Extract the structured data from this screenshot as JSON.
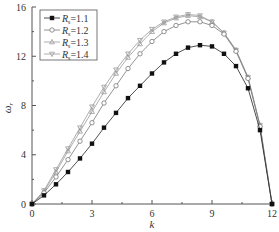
{
  "chart_data": {
    "type": "line",
    "title": "",
    "xlabel": "k",
    "ylabel": "ω_r",
    "xlim": [
      0,
      12
    ],
    "ylim": [
      0,
      16
    ],
    "xticks": [
      0,
      3,
      6,
      9,
      12
    ],
    "yticks": [
      0,
      4,
      8,
      12,
      16
    ],
    "grid": false,
    "legend_position": "upper left",
    "x": [
      0,
      0.6,
      1.2,
      1.8,
      2.4,
      3.0,
      3.6,
      4.2,
      4.8,
      5.4,
      6.0,
      6.6,
      7.2,
      7.8,
      8.4,
      9.0,
      9.6,
      10.2,
      10.8,
      11.4,
      12.0
    ],
    "series": [
      {
        "name": "Rs=1.1",
        "label_main": "R",
        "label_sub": "s",
        "label_value": "=1.1",
        "marker": "filled-square",
        "values": [
          0,
          0.7,
          1.6,
          2.6,
          3.7,
          4.9,
          6.2,
          7.4,
          8.6,
          9.6,
          10.6,
          11.5,
          12.2,
          12.7,
          12.9,
          12.8,
          12.2,
          11.2,
          9.4,
          6.0,
          0
        ]
      },
      {
        "name": "Rs=1.2",
        "label_main": "R",
        "label_sub": "s",
        "label_value": "=1.2",
        "marker": "open-circle",
        "values": [
          0,
          0.9,
          2.2,
          3.6,
          5.1,
          6.6,
          8.2,
          9.6,
          11.0,
          12.2,
          13.2,
          14.0,
          14.5,
          14.8,
          14.8,
          14.5,
          13.8,
          12.4,
          10.2,
          6.3,
          0
        ]
      },
      {
        "name": "Rs=1.3",
        "label_main": "R",
        "label_sub": "s",
        "label_value": "=1.3",
        "marker": "open-triangle-up",
        "values": [
          0,
          1.0,
          2.6,
          4.3,
          5.9,
          7.5,
          9.1,
          10.6,
          11.9,
          13.0,
          14.0,
          14.7,
          15.1,
          15.3,
          15.2,
          14.8,
          13.9,
          12.5,
          10.3,
          6.4,
          0
        ]
      },
      {
        "name": "Rs=1.4",
        "label_main": "R",
        "label_sub": "s",
        "label_value": "=1.4",
        "marker": "open-triangle-down",
        "values": [
          0,
          1.1,
          2.8,
          4.5,
          6.2,
          7.9,
          9.5,
          10.9,
          12.2,
          13.3,
          14.2,
          14.8,
          15.2,
          15.4,
          15.3,
          14.8,
          13.9,
          12.5,
          10.3,
          6.4,
          0
        ]
      }
    ]
  }
}
